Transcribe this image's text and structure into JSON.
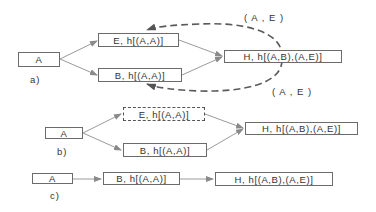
{
  "diagram": {
    "colors": {
      "box_border": "#6b6b6b",
      "edge": "#9a9a9a",
      "dashed_edge": "#5a5a5a",
      "text": "#333333"
    },
    "panel_a": {
      "label": "a)",
      "nodes": {
        "a": "A",
        "e": "E, h[(A,A)]",
        "b": "B, h[(A,A)]",
        "h": "H, h[(A,B),(A,E)]"
      },
      "edge_labels": {
        "top": "( A , E )",
        "bottom": "( A , E )"
      }
    },
    "panel_b": {
      "label": "b)",
      "nodes": {
        "a": "A",
        "e": "E, h[(A,A)]",
        "b": "B, h[(A,A)]",
        "h": "H, h[(A,B),(A,E)]"
      }
    },
    "panel_c": {
      "label": "c)",
      "nodes": {
        "a": "A",
        "b": "B, h[(A,A)]",
        "h": "H, h[(A,B),(A,E)]"
      }
    }
  }
}
